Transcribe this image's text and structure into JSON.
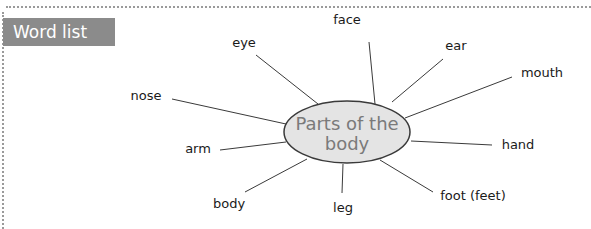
{
  "header": {
    "title": "Word list"
  },
  "diagram": {
    "center": {
      "line1": "Parts of the",
      "line2": "body"
    },
    "words": [
      {
        "label": "face",
        "x": 347,
        "y": 24
      },
      {
        "label": "eye",
        "x": 233,
        "y": 43
      },
      {
        "label": "ear",
        "x": 446,
        "y": 50
      },
      {
        "label": "mouth",
        "x": 524,
        "y": 77
      },
      {
        "label": "nose",
        "x": 160,
        "y": 100
      },
      {
        "label": "arm",
        "x": 192,
        "y": 152
      },
      {
        "label": "hand",
        "x": 504,
        "y": 149
      },
      {
        "label": "body",
        "x": 213,
        "y": 207
      },
      {
        "label": "leg",
        "x": 334,
        "y": 212
      },
      {
        "label": "foot (feet)",
        "x": 444,
        "y": 199
      }
    ]
  },
  "colors": {
    "header_bg": "#8b8b8b",
    "ellipse_fill": "#e4e4e4",
    "ellipse_stroke": "#3a3a3a",
    "center_text": "#7a7a7a"
  }
}
